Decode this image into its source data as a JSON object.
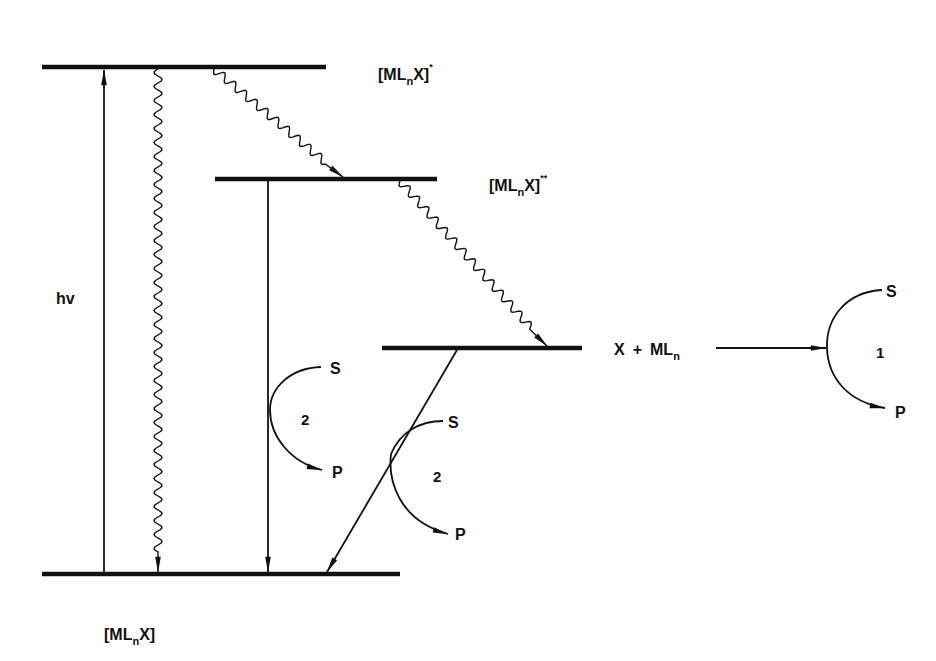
{
  "diagram": {
    "type": "energy-level diagram",
    "colors": {
      "line": "#111111",
      "background": "#ffffff"
    },
    "levels": [
      {
        "id": "excited-1",
        "label_main": "[ML",
        "label_sub": "n",
        "label_end": "X]",
        "label_sup": "*"
      },
      {
        "id": "excited-2",
        "label_main": "[ML",
        "label_sub": "n",
        "label_end": "X]",
        "label_sup": "**"
      },
      {
        "id": "dissociative",
        "label": ""
      },
      {
        "id": "ground",
        "label_main": "[ML",
        "label_sub": "n",
        "label_end": "X]"
      }
    ],
    "excitation_label": "hv",
    "products": {
      "x": "X",
      "plus": "+",
      "ml": "ML",
      "ml_sub": "n"
    },
    "cycles": [
      {
        "id": "cycle-1",
        "number": "1",
        "substrate": "S",
        "product": "P"
      },
      {
        "id": "cycle-2a",
        "number": "2",
        "substrate": "S",
        "product": "P"
      },
      {
        "id": "cycle-2b",
        "number": "2",
        "substrate": "S",
        "product": "P"
      }
    ]
  }
}
